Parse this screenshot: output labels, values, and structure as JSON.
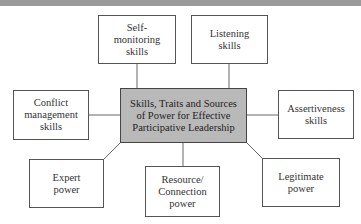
{
  "diagram": {
    "center": {
      "label": "Skills, Traits and Sources\nof Power for Effective\nParticipative Leadership"
    },
    "nodes": [
      {
        "id": "self-monitoring",
        "label": "Self-\nmonitoring\nskills"
      },
      {
        "id": "listening",
        "label": "Listening\nskills"
      },
      {
        "id": "conflict",
        "label": "Conflict\nmanagement\nskills"
      },
      {
        "id": "assertiveness",
        "label": "Assertiveness\nskills"
      },
      {
        "id": "expert",
        "label": "Expert\npower"
      },
      {
        "id": "resource",
        "label": "Resource/\nConnection\npower"
      },
      {
        "id": "legitimate",
        "label": "Legitimate\npower"
      }
    ],
    "colors": {
      "center_fill": "#b9b9b9",
      "border": "#555555",
      "line": "#666666"
    }
  }
}
